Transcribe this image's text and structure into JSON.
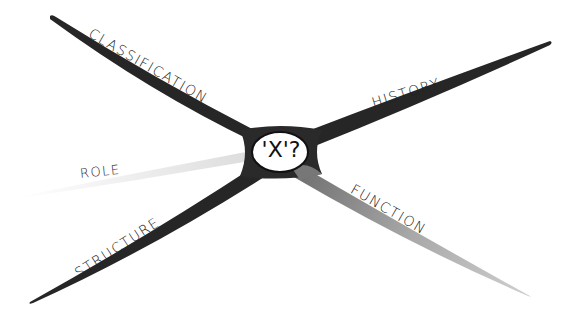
{
  "diagram": {
    "type": "concept-cross",
    "center": {
      "label": "'X'?"
    },
    "branches": [
      {
        "id": "classification",
        "label": "CLASSIFICATION",
        "direction": "upper-left",
        "shade": "#222222"
      },
      {
        "id": "history",
        "label": "HISTORY",
        "direction": "upper-right",
        "shade": "#222222"
      },
      {
        "id": "role",
        "label": "ROLE",
        "direction": "left",
        "shade": "#e6e6e6"
      },
      {
        "id": "structure",
        "label": "STRUCTURE",
        "direction": "lower-left",
        "shade": "#222222"
      },
      {
        "id": "function",
        "label": "FUNCTION",
        "direction": "lower-right",
        "shade": "#9a9a9a"
      }
    ]
  }
}
